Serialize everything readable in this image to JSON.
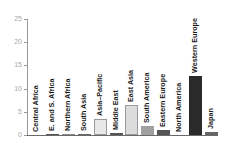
{
  "chart_data": {
    "type": "bar",
    "title": "",
    "xlabel": "",
    "ylabel": "",
    "ylim": [
      0,
      25
    ],
    "yticks": [
      0,
      5,
      10,
      15,
      20,
      25
    ],
    "grid": false,
    "legend": null,
    "categories": [
      "Central Africa",
      "E. and S. Africa",
      "Northern Africa",
      "South Asia",
      "Asia–Pacific",
      "Middle East",
      "East Asia",
      "South America",
      "Eastern Europe",
      "North America",
      "Western Europe",
      "Japan"
    ],
    "values": [
      0.0,
      0.3,
      0.3,
      0.3,
      3.4,
      0.5,
      6.5,
      2.0,
      1.1,
      0.0,
      12.7,
      0.7
    ],
    "bar_colors": [
      "#555555",
      "#555555",
      "#888888",
      "#666666",
      "#e8e8e8",
      "#555555",
      "#dcdcdc",
      "#a0a0a0",
      "#555555",
      "#555555",
      "#2a2a2a",
      "#666666"
    ]
  },
  "axis": {
    "ytick_labels": [
      "0",
      "5",
      "10",
      "15",
      "20",
      "25"
    ]
  }
}
